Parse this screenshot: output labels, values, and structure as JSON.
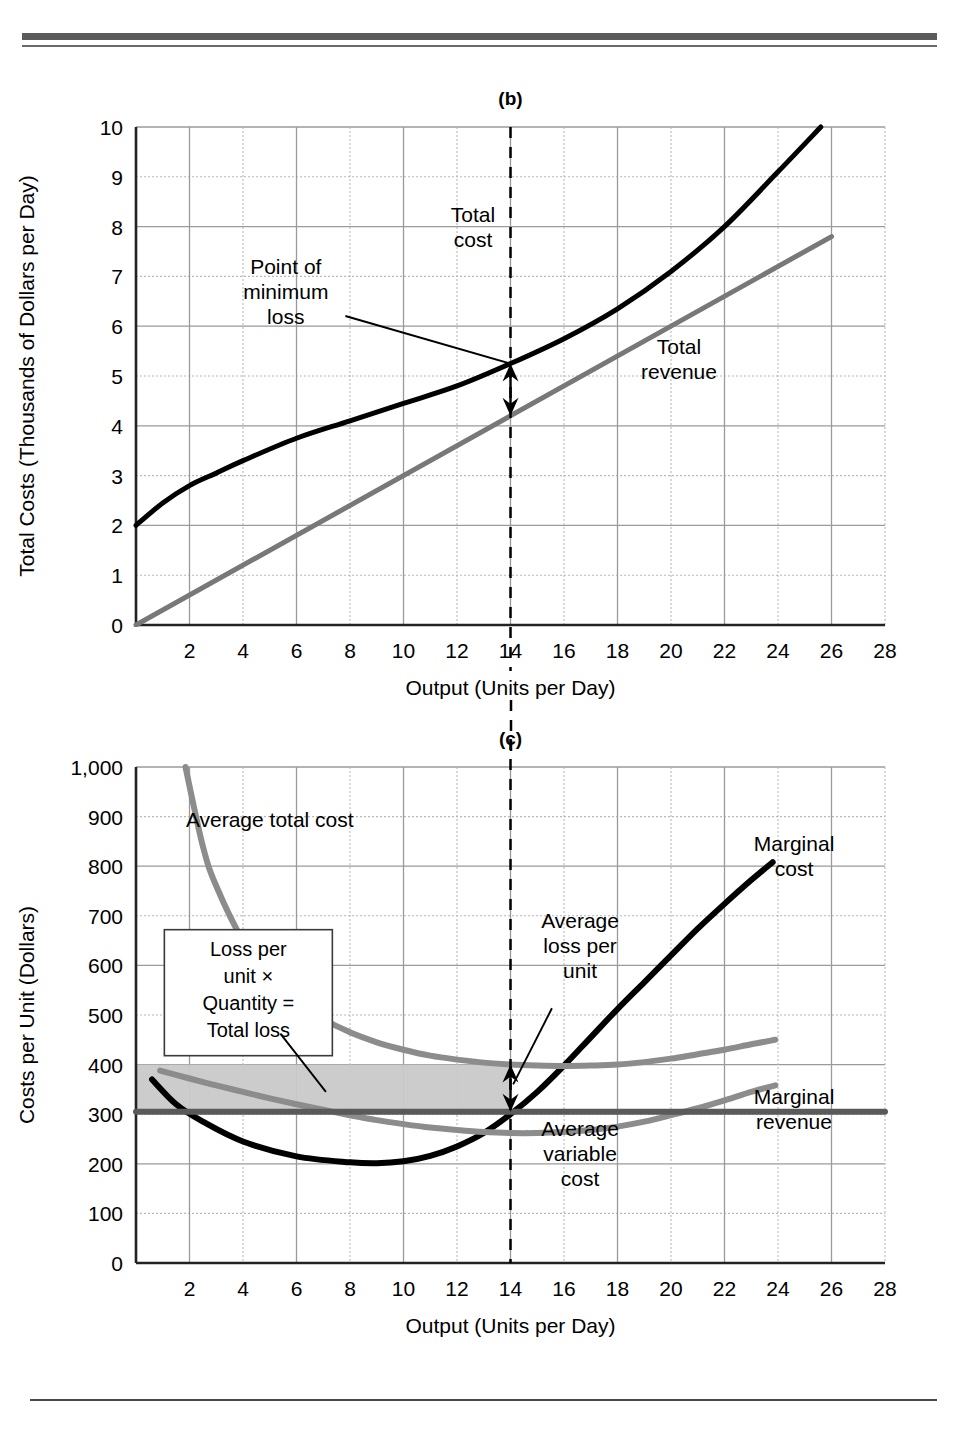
{
  "figure": {
    "panels": [
      "(b)",
      "(c)"
    ],
    "connector_note": "dashed vertical line at output 14 links panel (b) and panel (c)"
  },
  "chart_data": [
    {
      "id": "panel-b",
      "type": "line",
      "title": "(b)",
      "xlabel": "Output (Units per Day)",
      "ylabel": "Total Costs (Thousands of Dollars per Day)",
      "xlim": [
        0,
        28
      ],
      "ylim": [
        0,
        10
      ],
      "xticks": [
        2,
        4,
        6,
        8,
        10,
        12,
        14,
        16,
        18,
        20,
        22,
        24,
        26,
        28
      ],
      "yticks": [
        0,
        1,
        2,
        3,
        4,
        5,
        6,
        7,
        8,
        9,
        10
      ],
      "grid": "major solid at even x / even y, dotted at odd y",
      "legend_position": "inline labels on curves",
      "marker_output": 14,
      "series": [
        {
          "name": "Total cost",
          "color": "#000000",
          "width": 5,
          "x": [
            0,
            1,
            2,
            3,
            4,
            6,
            8,
            10,
            12,
            14,
            16,
            18,
            20,
            22,
            24,
            25.6
          ],
          "y": [
            2.0,
            2.45,
            2.8,
            3.05,
            3.3,
            3.75,
            4.1,
            4.45,
            4.8,
            5.25,
            5.75,
            6.35,
            7.1,
            8.0,
            9.1,
            10.0
          ]
        },
        {
          "name": "Total revenue",
          "color": "#787878",
          "width": 5,
          "x": [
            0,
            26
          ],
          "y": [
            0.0,
            7.8
          ]
        }
      ],
      "annotations": [
        {
          "text": "Total\ncost",
          "x_label": 12.6,
          "y_label": 7.85
        },
        {
          "text": "Total\nrevenue",
          "x_label": 20.3,
          "y_label": 5.2
        },
        {
          "text": "Point of\nminimum\nloss",
          "x_label": 5.6,
          "y_label": 6.55,
          "leader_to": {
            "x": 14,
            "y": 5.25
          }
        },
        {
          "text": "double-headed arrow",
          "x": 14,
          "y_from": 4.2,
          "y_to": 5.25
        }
      ]
    },
    {
      "id": "panel-c",
      "type": "line",
      "title": "(c)",
      "xlabel": "Output (Units per Day)",
      "ylabel": "Costs per Unit (Dollars)",
      "xlim": [
        0,
        28
      ],
      "ylim": [
        0,
        1000
      ],
      "xticks": [
        2,
        4,
        6,
        8,
        10,
        12,
        14,
        16,
        18,
        20,
        22,
        24,
        26,
        28
      ],
      "yticks": [
        0,
        100,
        200,
        300,
        400,
        500,
        600,
        700,
        800,
        900,
        1000
      ],
      "ytick_labels": [
        "0",
        "100",
        "200",
        "300",
        "400",
        "500",
        "600",
        "700",
        "800",
        "900",
        "1,000"
      ],
      "grid": "major solid at even x, solid at even hundreds, dotted at odd hundreds",
      "legend_position": "inline labels on curves",
      "marker_output": 14,
      "shaded_region": {
        "name": "total loss rectangle",
        "x_from": 0,
        "x_to": 14,
        "y_from": 300,
        "y_to": 400,
        "fill": "#c9c9c9"
      },
      "series": [
        {
          "name": "Marginal cost",
          "color": "#000000",
          "width": 6,
          "x": [
            0.6,
            1.5,
            2.5,
            4,
            6,
            8,
            9,
            10,
            11,
            12,
            13,
            14,
            15,
            16,
            17,
            18,
            19,
            20,
            21,
            22,
            23,
            23.8
          ],
          "y": [
            370,
            320,
            285,
            245,
            215,
            203,
            201,
            205,
            216,
            235,
            262,
            300,
            345,
            398,
            455,
            512,
            566,
            620,
            674,
            724,
            772,
            808
          ]
        },
        {
          "name": "Average total cost",
          "color": "#8c8c8c",
          "width": 6,
          "x": [
            1.85,
            2.5,
            3,
            4,
            5,
            6,
            7,
            8,
            9,
            10,
            11,
            12,
            13,
            14,
            15,
            16,
            17,
            18,
            19,
            20,
            21,
            22,
            23,
            23.9
          ],
          "y": [
            1000,
            840,
            760,
            650,
            580,
            528,
            492,
            465,
            445,
            430,
            418,
            410,
            404,
            400,
            398,
            397,
            398,
            400,
            405,
            412,
            421,
            430,
            441,
            450
          ]
        },
        {
          "name": "Average variable cost",
          "color": "#8c8c8c",
          "width": 6,
          "x": [
            0.9,
            2,
            3,
            4,
            5,
            6,
            7,
            8,
            9,
            10,
            11,
            12,
            13,
            14,
            15,
            16,
            17,
            18,
            19,
            20,
            21,
            22,
            23,
            23.9
          ],
          "y": [
            388,
            372,
            358,
            345,
            332,
            320,
            309,
            298,
            288,
            280,
            273,
            268,
            264,
            262,
            262,
            264,
            268,
            275,
            285,
            298,
            312,
            328,
            345,
            358
          ]
        },
        {
          "name": "Marginal revenue",
          "color": "#5a5a5a",
          "width": 6,
          "x": [
            0,
            28
          ],
          "y": [
            305,
            305
          ]
        }
      ],
      "annotations": [
        {
          "text": "Average total cost",
          "x_label": 5.0,
          "y_label": 880
        },
        {
          "text": "Marginal\ncost",
          "x_label": 24.6,
          "y_label": 805
        },
        {
          "text": "Marginal\nrevenue",
          "x_label": 24.6,
          "y_label": 295
        },
        {
          "text": "Average\nloss per\nunit",
          "x_label": 16.6,
          "y_label": 625,
          "leader_to": {
            "x": 14.1,
            "y": 360
          }
        },
        {
          "text": "Average\nvariable\ncost",
          "x_label": 16.6,
          "y_label": 205,
          "leader_to": {
            "x": 14.6,
            "y": 268
          }
        },
        {
          "text": "Loss per\nunit ×\nQuantity =\nTotal loss",
          "boxed": true,
          "x_label": 4.2,
          "y_label": 545,
          "leader_to": {
            "x": 7.1,
            "y": 345
          }
        },
        {
          "text": "double-headed arrow",
          "x": 14,
          "y_from": 305,
          "y_to": 400
        }
      ]
    }
  ],
  "labels": {
    "panel_b": "(b)",
    "panel_c": "(c)",
    "xlabel": "Output (Units per Day)",
    "ylabel_b": "Total Costs (Thousands of Dollars per Day)",
    "ylabel_c": "Costs per Unit (Dollars)",
    "total_cost": "Total\ncost",
    "total_revenue": "Total\nrevenue",
    "point_min_loss": "Point of\nminimum\nloss",
    "avg_total_cost": "Average total cost",
    "marginal_cost": "Marginal\ncost",
    "marginal_revenue": "Marginal\nrevenue",
    "avg_loss_per_unit": "Average\nloss per\nunit",
    "avg_variable_cost": "Average\nvariable\ncost",
    "loss_box": "Loss per\nunit ×\nQuantity =\nTotal loss"
  },
  "colors": {
    "black_curve": "#000000",
    "gray_curve": "#8c8c8c",
    "dark_gray_curve": "#5a5a5a",
    "revenue_gray": "#787878",
    "shade": "#c9c9c9",
    "grid_solid": "#9a9a9a",
    "grid_dotted": "#b8b8b8",
    "rule": "#5b5b5b"
  }
}
